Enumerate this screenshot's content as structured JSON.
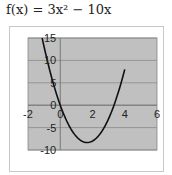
{
  "title": {
    "prefix": "f(x) = 3x",
    "sup": "2",
    "suffix": " − 10x",
    "full": "f(x) = 3x² − 10x"
  },
  "chart_data": {
    "type": "line",
    "title": "f(x) = 3x² − 10x",
    "xlabel": "",
    "ylabel": "",
    "xlim": [
      -2,
      6
    ],
    "ylim": [
      -10,
      15
    ],
    "x_ticks": [
      -2,
      0,
      2,
      4,
      6
    ],
    "y_ticks": [
      15,
      10,
      5,
      0,
      -5,
      -10
    ],
    "x_tick_labels": [
      "-2",
      "0",
      "2",
      "4",
      "6"
    ],
    "y_tick_labels": [
      "15",
      "10",
      "5",
      "0",
      "-5",
      "-10"
    ],
    "grid": true,
    "legend": null,
    "plot_background": "#c0c0c0",
    "series": [
      {
        "name": "f(x)",
        "color": "#111111",
        "x": [
          -1.3,
          -1,
          -0.5,
          0,
          0.5,
          1,
          1.5,
          1.667,
          2,
          2.5,
          3,
          3.5,
          4
        ],
        "y": [
          18.07,
          13,
          5.75,
          0,
          -4.25,
          -7,
          -8.25,
          -8.33,
          -8,
          -6.25,
          -3,
          1.75,
          8
        ]
      }
    ]
  }
}
